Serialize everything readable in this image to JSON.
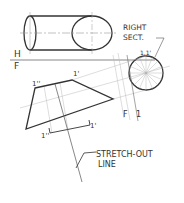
{
  "labels": {
    "right_sect_line1": "RIGHT",
    "right_sect_line2": "SECT.",
    "section_point": "1,1'",
    "h": "H",
    "f": "F",
    "fold_f": "F",
    "fold_1": "1",
    "pt_1pp_top": "1''",
    "pt_1p_top": "1'",
    "pt_1pp_bottom": "1''",
    "pt_1p_bottom": "1'",
    "stretch_line1": "STRETCH-OUT",
    "stretch_line2": "LINE"
  },
  "colors": {
    "ink": "#333333",
    "thin": "#9a9a9a",
    "background": "#ffffff"
  }
}
